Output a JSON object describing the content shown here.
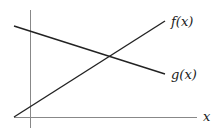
{
  "diagram": {
    "type": "function-graph",
    "axes": {
      "x_label": "x",
      "y_axis": {
        "x": 30,
        "y1": 10,
        "y2": 128
      },
      "x_axis": {
        "y": 117,
        "x1": 14,
        "x2": 197
      },
      "color": "#888888"
    },
    "curves": [
      {
        "name": "f",
        "label": "f(x)",
        "x1": 14,
        "y1": 117,
        "x2": 165,
        "y2": 21,
        "color": "#222222"
      },
      {
        "name": "g",
        "label": "g(x)",
        "x1": 14,
        "y1": 26,
        "x2": 165,
        "y2": 74,
        "color": "#222222"
      }
    ],
    "labels": {
      "f": "f(x)",
      "g": "g(x)",
      "x": "x"
    }
  }
}
